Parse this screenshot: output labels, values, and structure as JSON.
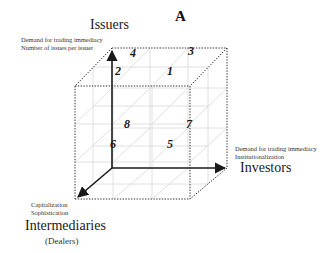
{
  "figure": {
    "label": "A"
  },
  "axes": {
    "vertical": {
      "title": "Issuers",
      "descriptors": [
        "Demand for trading immediacy",
        "Number of issues per issuer"
      ]
    },
    "horizontal": {
      "title": "Investors",
      "descriptors": [
        "Demand for trading immediacy",
        "Institutionalization"
      ]
    },
    "depth": {
      "title": "Intermediaries",
      "subtitle": "(Dealers)",
      "descriptors": [
        "Capitalization",
        "Sophistication"
      ]
    }
  },
  "cells": [
    {
      "id": "1",
      "label": "1"
    },
    {
      "id": "2",
      "label": "2"
    },
    {
      "id": "3",
      "label": "3"
    },
    {
      "id": "4",
      "label": "4"
    },
    {
      "id": "5",
      "label": "5"
    },
    {
      "id": "6",
      "label": "6"
    },
    {
      "id": "7",
      "label": "7"
    },
    {
      "id": "8",
      "label": "8"
    }
  ],
  "colors": {
    "axis": "#1a1a1a",
    "cube_edge": "#333333",
    "grid": "#d8d8d8"
  }
}
